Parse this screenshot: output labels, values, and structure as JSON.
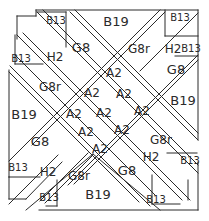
{
  "diagram": {
    "pieces": [
      {
        "id": "b13-top-left-upper",
        "label": "B13"
      },
      {
        "id": "b19-top",
        "label": "B19"
      },
      {
        "id": "b13-top-right-upper",
        "label": "B13"
      },
      {
        "id": "g8-top-left",
        "label": "G8"
      },
      {
        "id": "g8r-top-right",
        "label": "G8r"
      },
      {
        "id": "h2-top-right",
        "label": "H2"
      },
      {
        "id": "b13-top-right-lower",
        "label": "B13"
      },
      {
        "id": "b13-top-left-lower",
        "label": "B13"
      },
      {
        "id": "h2-top-left",
        "label": "H2"
      },
      {
        "id": "g8-right-upper",
        "label": "G8"
      },
      {
        "id": "g8r-left-upper",
        "label": "G8r"
      },
      {
        "id": "b19-right",
        "label": "B19"
      },
      {
        "id": "b19-left",
        "label": "B19"
      },
      {
        "id": "g8-left-lower",
        "label": "G8"
      },
      {
        "id": "g8r-right-lower",
        "label": "G8r"
      },
      {
        "id": "b13-bottom-left-upper",
        "label": "B13"
      },
      {
        "id": "h2-bottom-left",
        "label": "H2"
      },
      {
        "id": "h2-bottom-right",
        "label": "H2"
      },
      {
        "id": "b13-bottom-right-upper",
        "label": "B13"
      },
      {
        "id": "g8r-bottom-left",
        "label": "G8r"
      },
      {
        "id": "g8-bottom-right",
        "label": "G8"
      },
      {
        "id": "b13-bottom-left-lower",
        "label": "B13"
      },
      {
        "id": "b19-bottom",
        "label": "B19"
      },
      {
        "id": "b13-bottom-right-lower",
        "label": "B13"
      },
      {
        "id": "a2-1",
        "label": "A2"
      },
      {
        "id": "a2-2",
        "label": "A2"
      },
      {
        "id": "a2-3",
        "label": "A2"
      },
      {
        "id": "a2-4",
        "label": "A2"
      },
      {
        "id": "a2-5",
        "label": "A2"
      },
      {
        "id": "a2-6",
        "label": "A2"
      },
      {
        "id": "a2-7",
        "label": "A2"
      },
      {
        "id": "a2-8",
        "label": "A2"
      },
      {
        "id": "a2-9",
        "label": "A2"
      }
    ]
  }
}
